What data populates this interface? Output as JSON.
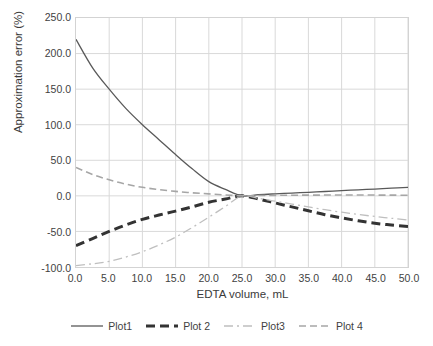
{
  "chart_data": {
    "type": "line",
    "title": "",
    "xlabel": "EDTA volume, mL",
    "ylabel": "Approximation error (%)",
    "xlim": [
      0.0,
      50.0
    ],
    "ylim": [
      -100.0,
      250.0
    ],
    "xticks": [
      "0.0",
      "5.0",
      "10.0",
      "15.0",
      "20.0",
      "25.0",
      "30.0",
      "35.0",
      "40.0",
      "45.0",
      "50.0"
    ],
    "yticks": [
      "250.0",
      "200.0",
      "150.0",
      "100.0",
      "50.0",
      "0.0",
      "-50.0",
      "-100.0"
    ],
    "grid": true,
    "legend_position": "bottom",
    "x": [
      0,
      2.5,
      5,
      7.5,
      10,
      12.5,
      15,
      17.5,
      20,
      22.5,
      25,
      27.5,
      30,
      32.5,
      35,
      37.5,
      40,
      42.5,
      45,
      47.5,
      50
    ],
    "series": [
      {
        "name": "Plot1",
        "color": "#595959",
        "style": "solid",
        "width": 1.3,
        "values": [
          220.0,
          180.0,
          150.0,
          123.0,
          100.0,
          79.0,
          58.0,
          38.0,
          20.0,
          9.0,
          0.0,
          1.6,
          2.8,
          3.9,
          5.0,
          6.1,
          7.3,
          8.5,
          9.6,
          10.8,
          12.0
        ]
      },
      {
        "name": "Plot 2",
        "color": "#333333",
        "style": "dashed",
        "width": 3.0,
        "values": [
          -70.0,
          -60.0,
          -50.0,
          -41.0,
          -33.0,
          -27.0,
          -21.5,
          -15.5,
          -9.0,
          -4.5,
          0.0,
          -4.5,
          -10.0,
          -15.5,
          -21.0,
          -26.5,
          -31.0,
          -35.0,
          -38.5,
          -41.0,
          -43.0
        ]
      },
      {
        "name": "Plot3",
        "color": "#bfbfbf",
        "style": "dashdot",
        "width": 1.3,
        "values": [
          -98.0,
          -95.5,
          -92.0,
          -86.0,
          -78.5,
          -69.0,
          -58.0,
          -44.5,
          -30.0,
          -15.0,
          0.0,
          -3.5,
          -7.5,
          -11.5,
          -15.5,
          -19.5,
          -23.0,
          -26.0,
          -29.0,
          -31.5,
          -34.0
        ]
      },
      {
        "name": "Plot 4",
        "color": "#a6a6a6",
        "style": "dashed",
        "width": 1.6,
        "values": [
          40.0,
          30.0,
          22.5,
          16.5,
          12.0,
          8.8,
          6.3,
          4.3,
          2.8,
          1.3,
          0.0,
          0.4,
          0.7,
          0.9,
          1.0,
          1.1,
          1.1,
          1.1,
          1.1,
          1.0,
          0.9
        ]
      }
    ]
  },
  "legend": {
    "items": [
      {
        "label": "Plot1"
      },
      {
        "label": "Plot 2"
      },
      {
        "label": "Plot3"
      },
      {
        "label": "Plot 4"
      }
    ]
  }
}
